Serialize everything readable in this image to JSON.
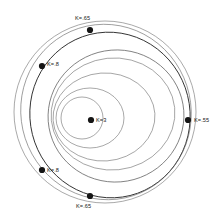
{
  "figure": {
    "title": "",
    "background_color": "#ffffff",
    "curve_color": "#6e6e6e",
    "marker_color": "#151515",
    "label_color": "#1a1a1a"
  },
  "chart_data": {
    "type": "line",
    "title": "",
    "subtitle": "",
    "xlabel": "",
    "ylabel": "",
    "grid": false,
    "legend_position": "none",
    "parameter_symbol": "K",
    "common_focus": {
      "x": 57,
      "y": 117
    },
    "xlim": [
      0,
      224
    ],
    "ylim": [
      0,
      218
    ],
    "annotations": [
      {
        "id": "k-top",
        "label": "K=.65",
        "point_x": 90,
        "point_y": 30,
        "label_x": 75,
        "label_y": 20,
        "anchor": "start"
      },
      {
        "id": "k-upper-left",
        "label": "K=.8",
        "point_x": 42,
        "point_y": 66,
        "label_x": 47,
        "label_y": 66,
        "anchor": "start"
      },
      {
        "id": "k-center",
        "label": "K=3",
        "point_x": 91,
        "point_y": 120,
        "label_x": 96,
        "label_y": 122,
        "anchor": "start"
      },
      {
        "id": "k-right",
        "label": "K=.55",
        "point_x": 188,
        "point_y": 120,
        "label_x": 194,
        "label_y": 122,
        "anchor": "start"
      },
      {
        "id": "k-lower-left",
        "label": "K=.8",
        "point_x": 42,
        "point_y": 170,
        "label_x": 47,
        "label_y": 172,
        "anchor": "start"
      },
      {
        "id": "k-bottom",
        "label": "K=.65",
        "point_x": 90,
        "point_y": 196,
        "label_x": 76,
        "label_y": 208,
        "anchor": "start"
      }
    ],
    "series": [
      {
        "name": "K=3",
        "k_value": 3,
        "style": "thin",
        "shape": "circle",
        "center_x": 82,
        "center_y": 118,
        "radius_x": 21,
        "radius_y": 21,
        "rotation": 0
      },
      {
        "name": "K=1.6",
        "k_value": 1.6,
        "style": "thin",
        "shape": "ellipse",
        "center_x": 90,
        "center_y": 118,
        "radius_x": 34,
        "radius_y": 30,
        "rotation": 0
      },
      {
        "name": "K=1.1",
        "k_value": 1.1,
        "style": "thin",
        "shape": "ellipse",
        "center_x": 104,
        "center_y": 117,
        "radius_x": 51,
        "radius_y": 44,
        "rotation": -4
      },
      {
        "name": "K=.9",
        "k_value": 0.9,
        "style": "thin",
        "shape": "ellipse",
        "center_x": 113,
        "center_y": 114,
        "radius_x": 62,
        "radius_y": 56,
        "rotation": -6
      },
      {
        "name": "K=.8",
        "k_value": 0.8,
        "style": "mid",
        "shape": "ellipse",
        "center_x": 116,
        "center_y": 116,
        "radius_x": 68,
        "radius_y": 66,
        "rotation": -10
      },
      {
        "name": "K=.65",
        "k_value": 0.65,
        "style": "heavy",
        "shape": "ellipse",
        "center_x": 110,
        "center_y": 115,
        "radius_x": 80,
        "radius_y": 83,
        "rotation": -14
      },
      {
        "name": "K=.55",
        "k_value": 0.55,
        "style": "thin",
        "shape": "ellipse",
        "center_x": 106,
        "center_y": 112,
        "radius_x": 85,
        "radius_y": 88,
        "rotation": -18
      },
      {
        "name": "outer-envelope",
        "k_value": 0.5,
        "style": "thin",
        "shape": "circle",
        "center_x": 105,
        "center_y": 112,
        "radius_x": 91,
        "radius_y": 91,
        "rotation": 0
      }
    ]
  }
}
